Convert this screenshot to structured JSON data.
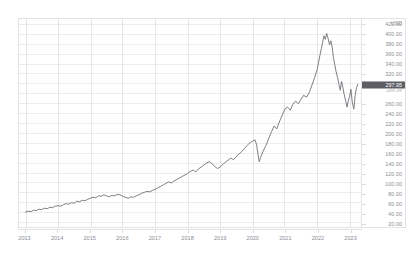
{
  "chart_data": {
    "type": "line",
    "title": "",
    "subtitle": "",
    "xlabel": "",
    "ylabel": "USD",
    "currency_label": "USD",
    "grid": true,
    "legend": "none",
    "xlim": [
      2012.8,
      2023.35
    ],
    "ylim": [
      10,
      430
    ],
    "x_tick_labels": [
      "2013",
      "2014",
      "2015",
      "2016",
      "2017",
      "2018",
      "2019",
      "2020",
      "2021",
      "2022",
      "2023"
    ],
    "x_ticks": [
      2013,
      2014,
      2015,
      2016,
      2017,
      2018,
      2019,
      2020,
      2021,
      2022,
      2023
    ],
    "y_tick_labels": [
      "420.00",
      "400.00",
      "380.00",
      "360.00",
      "340.00",
      "320.00",
      "300.00",
      "280.00",
      "260.00",
      "240.00",
      "220.00",
      "200.00",
      "180.00",
      "160.00",
      "140.00",
      "120.00",
      "100.00",
      "80.00",
      "60.00",
      "40.00",
      "20.00"
    ],
    "y_ticks": [
      420,
      400,
      380,
      360,
      340,
      320,
      300,
      280,
      260,
      240,
      220,
      200,
      180,
      160,
      140,
      120,
      100,
      80,
      60,
      40,
      20
    ],
    "y_ticks_visible": [
      420,
      400,
      380,
      360,
      340,
      320,
      260,
      240,
      220,
      200,
      180,
      160,
      140,
      120,
      100,
      80,
      60,
      40,
      20
    ],
    "current_price": "297.95",
    "previous_close": "288.94",
    "current_price_value": 297.95,
    "previous_close_value": 288.94,
    "line_color": "#6f6f76",
    "grid_color": "#ececef",
    "badge_color": "#5d5d64",
    "series": [
      {
        "name": "price",
        "x": [
          2013.0,
          2013.08,
          2013.17,
          2013.25,
          2013.33,
          2013.42,
          2013.5,
          2013.58,
          2013.67,
          2013.75,
          2013.83,
          2013.92,
          2014.0,
          2014.08,
          2014.17,
          2014.25,
          2014.33,
          2014.42,
          2014.5,
          2014.58,
          2014.67,
          2014.75,
          2014.83,
          2014.92,
          2015.0,
          2015.08,
          2015.17,
          2015.25,
          2015.33,
          2015.42,
          2015.5,
          2015.58,
          2015.67,
          2015.75,
          2015.83,
          2015.92,
          2016.0,
          2016.08,
          2016.17,
          2016.25,
          2016.33,
          2016.42,
          2016.5,
          2016.58,
          2016.67,
          2016.75,
          2016.83,
          2016.92,
          2017.0,
          2017.08,
          2017.17,
          2017.25,
          2017.33,
          2017.42,
          2017.5,
          2017.58,
          2017.67,
          2017.75,
          2017.83,
          2017.92,
          2018.0,
          2018.08,
          2018.17,
          2018.25,
          2018.33,
          2018.42,
          2018.5,
          2018.58,
          2018.67,
          2018.75,
          2018.83,
          2018.92,
          2019.0,
          2019.08,
          2019.17,
          2019.25,
          2019.33,
          2019.42,
          2019.5,
          2019.58,
          2019.67,
          2019.75,
          2019.83,
          2019.92,
          2020.0,
          2020.08,
          2020.13,
          2020.17,
          2020.21,
          2020.25,
          2020.33,
          2020.42,
          2020.5,
          2020.58,
          2020.67,
          2020.75,
          2020.83,
          2020.92,
          2021.0,
          2021.08,
          2021.17,
          2021.25,
          2021.33,
          2021.42,
          2021.5,
          2021.58,
          2021.67,
          2021.75,
          2021.83,
          2021.92,
          2022.0,
          2022.04,
          2022.08,
          2022.13,
          2022.17,
          2022.21,
          2022.25,
          2022.29,
          2022.33,
          2022.38,
          2022.42,
          2022.46,
          2022.5,
          2022.54,
          2022.58,
          2022.63,
          2022.67,
          2022.71,
          2022.75,
          2022.79,
          2022.83,
          2022.88,
          2022.92,
          2022.96,
          2023.0,
          2023.04,
          2023.08,
          2023.13,
          2023.17,
          2023.21,
          2023.25
        ],
        "values": [
          40,
          42,
          41,
          44,
          43,
          46,
          45,
          48,
          47,
          50,
          49,
          52,
          53,
          52,
          55,
          57,
          56,
          59,
          58,
          62,
          61,
          64,
          63,
          66,
          68,
          70,
          69,
          73,
          72,
          75,
          73,
          71,
          74,
          73,
          76,
          75,
          72,
          70,
          68,
          71,
          70,
          73,
          75,
          78,
          80,
          82,
          81,
          84,
          86,
          89,
          92,
          95,
          98,
          101,
          99,
          103,
          106,
          109,
          112,
          115,
          118,
          122,
          125,
          121,
          127,
          131,
          135,
          139,
          142,
          138,
          133,
          128,
          131,
          136,
          141,
          145,
          149,
          146,
          152,
          157,
          162,
          168,
          174,
          180,
          183,
          186,
          176,
          158,
          142,
          150,
          163,
          175,
          188,
          201,
          214,
          208,
          222,
          236,
          248,
          252,
          246,
          258,
          264,
          259,
          268,
          276,
          272,
          281,
          295,
          312,
          328,
          342,
          356,
          371,
          384,
          396,
          389,
          401,
          392,
          378,
          386,
          374,
          352,
          338,
          324,
          311,
          298,
          286,
          304,
          292,
          278,
          264,
          252,
          266,
          274,
          288,
          262,
          248,
          276,
          291,
          298
        ]
      }
    ]
  }
}
